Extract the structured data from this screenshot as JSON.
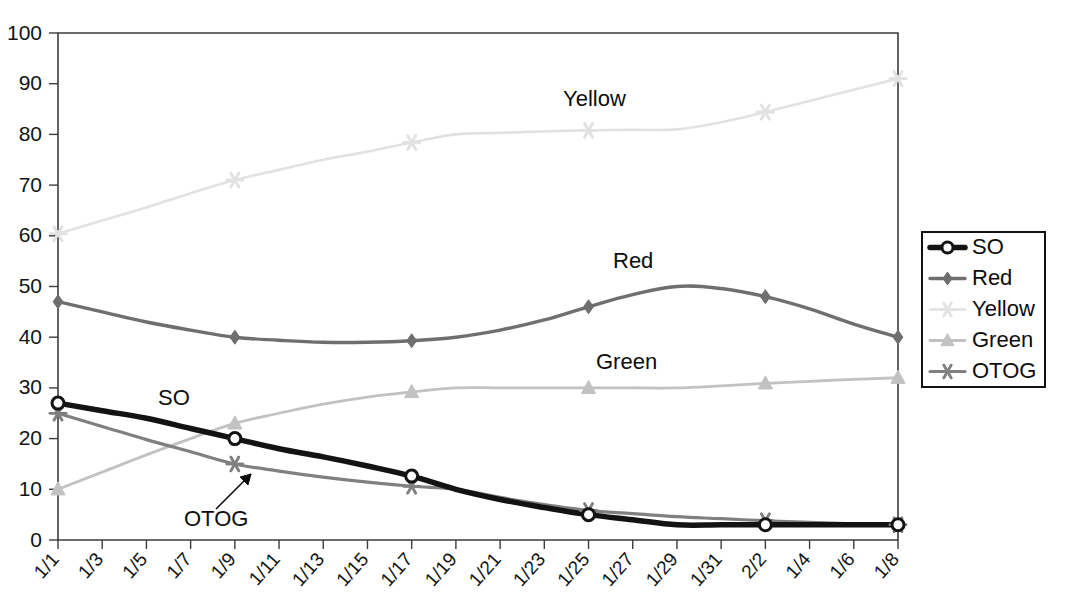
{
  "chart_data": {
    "type": "line",
    "title": "",
    "xlabel": "",
    "ylabel": "",
    "ylim": [
      0,
      100
    ],
    "ytick_step": 10,
    "grid": false,
    "legend_position": "right-outside",
    "marker_interval": 4,
    "categories": [
      "1/1",
      "1/3",
      "1/5",
      "1/7",
      "1/9",
      "1/11",
      "1/13",
      "1/15",
      "1/17",
      "1/19",
      "1/21",
      "1/23",
      "1/25",
      "1/27",
      "1/29",
      "1/31",
      "2/2",
      "1/4",
      "1/6",
      "1/8"
    ],
    "yticks": [
      0,
      10,
      20,
      30,
      40,
      50,
      60,
      70,
      80,
      90,
      100
    ],
    "series": [
      {
        "name": "SO",
        "color": "#131313",
        "marker": "circle",
        "width": 5.5,
        "values": [
          27,
          25.5,
          24,
          22,
          20,
          18,
          16.4,
          14.6,
          12.6,
          10,
          8,
          6.4,
          5,
          4,
          3,
          3,
          3,
          3,
          3,
          3
        ]
      },
      {
        "name": "Red",
        "color": "#6f6f6f",
        "marker": "diamond",
        "width": 3.4,
        "values": [
          47,
          45,
          43,
          41.4,
          40,
          39.4,
          39,
          39,
          39.3,
          40,
          41.4,
          43.4,
          46,
          48.4,
          50,
          49.6,
          48,
          45.6,
          42.6,
          40
        ]
      },
      {
        "name": "Yellow",
        "color": "#e2e2e2",
        "marker": "asterisk",
        "width": 2.6,
        "values": [
          60.4,
          63,
          65.6,
          68.4,
          71,
          73,
          75,
          76.6,
          78.4,
          80,
          80.3,
          80.6,
          80.8,
          80.9,
          81,
          82.4,
          84.4,
          86.6,
          88.8,
          91
        ]
      },
      {
        "name": "Green",
        "color": "#c2c2c2",
        "marker": "triangle",
        "width": 2.8,
        "values": [
          10,
          13.4,
          16.8,
          20,
          23,
          25,
          26.8,
          28.2,
          29.2,
          30,
          30,
          30,
          30,
          30,
          30,
          30.4,
          30.9,
          31.3,
          31.7,
          32
        ]
      },
      {
        "name": "OTOG",
        "color": "#808080",
        "marker": "asterisk",
        "width": 3.2,
        "values": [
          25,
          22.4,
          19.8,
          17.4,
          15,
          13.6,
          12.4,
          11.4,
          10.6,
          10,
          8.4,
          7,
          5.8,
          5.2,
          4.6,
          4.2,
          3.8,
          3.5,
          3.2,
          3
        ]
      }
    ],
    "annotations": [
      {
        "id": "label-so",
        "text": "SO",
        "x_px": 158,
        "y_px": 405
      },
      {
        "id": "label-yellow",
        "text": "Yellow",
        "x_px": 563,
        "y_px": 106
      },
      {
        "id": "label-red",
        "text": "Red",
        "x_px": 613,
        "y_px": 268
      },
      {
        "id": "label-green",
        "text": "Green",
        "x_px": 596,
        "y_px": 369
      },
      {
        "id": "label-otog",
        "text": "OTOG",
        "x_px": 184,
        "y_px": 526
      }
    ]
  },
  "legend": {
    "entries": [
      {
        "label": "SO"
      },
      {
        "label": "Red"
      },
      {
        "label": "Yellow"
      },
      {
        "label": "Green"
      },
      {
        "label": "OTOG"
      }
    ]
  }
}
